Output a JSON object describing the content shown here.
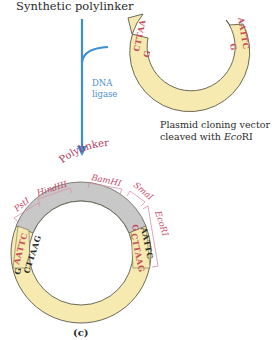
{
  "title": "Synthetic polylinker",
  "enzyme": {
    "line1": "DNA",
    "line2": "ligase"
  },
  "vector_caption": {
    "line1": "Plasmid cloning vector",
    "line2_prefix": "cleaved with ",
    "line2_italic": "Eco",
    "line2_suffix": "RI"
  },
  "top_vector": {
    "left_end": "CTTAA",
    "left_end_g": "G",
    "right_end": "AATTC",
    "right_end_g": "G"
  },
  "ring": {
    "polylinker_label": "Polylinker",
    "left_junction": {
      "outer": "AATTC",
      "outer_g": "G",
      "inner": "CTTAAG"
    },
    "right_junction": {
      "outer": "AATTC",
      "outer_g": "G",
      "inner": "CTTAAG"
    },
    "sites": [
      "PstI",
      "HindIII",
      "BamHI",
      "SmaI",
      "EcoRI"
    ]
  },
  "panel_label": "(c)",
  "colors": {
    "vector_fill": "#f7eab0",
    "polylinker_fill": "#c8c8c8",
    "arrow": "#3a8fd8",
    "site_text": "#c44a6a",
    "outline": "#5a5a4a"
  }
}
